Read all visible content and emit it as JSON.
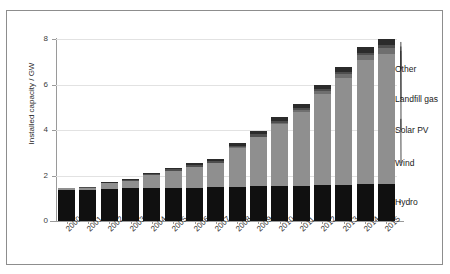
{
  "chart_data": {
    "type": "bar",
    "subtype": "stacked-bar",
    "title": "",
    "xlabel": "",
    "ylabel": "Installed capacity / GW",
    "ylim": [
      0,
      8
    ],
    "yticks": [
      0,
      2,
      4,
      6,
      8
    ],
    "ytick_labels": [
      "0",
      "2",
      "4",
      "6",
      "8"
    ],
    "grid": "horizontal",
    "legend": "annotated-callouts-right",
    "categories": [
      "2000",
      "2001",
      "2002",
      "2003",
      "2004",
      "2005",
      "2006",
      "2007",
      "2008",
      "2009",
      "2010",
      "2011",
      "2012",
      "2013",
      "2014",
      "2015"
    ],
    "series": [
      {
        "name": "Hydro",
        "color": "#101010",
        "values": [
          1.38,
          1.38,
          1.42,
          1.44,
          1.46,
          1.46,
          1.46,
          1.48,
          1.5,
          1.52,
          1.54,
          1.56,
          1.58,
          1.6,
          1.62,
          1.64
        ]
      },
      {
        "name": "Wind",
        "color": "#8f8f8f",
        "values": [
          0.05,
          0.07,
          0.23,
          0.33,
          0.56,
          0.76,
          0.92,
          1.08,
          1.7,
          2.16,
          2.72,
          3.22,
          4.0,
          4.68,
          5.44,
          5.7
        ]
      },
      {
        "name": "Solar PV",
        "color": "#6f6f6f",
        "values": [
          0.0,
          0.0,
          0.0,
          0.0,
          0.0,
          0.0,
          0.0,
          0.0,
          0.02,
          0.03,
          0.05,
          0.08,
          0.12,
          0.18,
          0.24,
          0.28
        ]
      },
      {
        "name": "Landfill gas",
        "color": "#4e4e4e",
        "values": [
          0.02,
          0.03,
          0.04,
          0.05,
          0.06,
          0.07,
          0.08,
          0.08,
          0.08,
          0.09,
          0.09,
          0.1,
          0.1,
          0.1,
          0.1,
          0.1
        ]
      },
      {
        "name": "Other",
        "color": "#2b2b2b",
        "values": [
          0.0,
          0.0,
          0.01,
          0.02,
          0.04,
          0.06,
          0.08,
          0.1,
          0.12,
          0.14,
          0.16,
          0.18,
          0.2,
          0.22,
          0.26,
          0.3
        ]
      }
    ],
    "totals": [
      1.45,
      1.48,
      1.7,
      1.84,
      2.12,
      2.35,
      2.54,
      2.74,
      3.42,
      3.94,
      4.56,
      5.14,
      6.0,
      6.78,
      7.66,
      8.02
    ],
    "annotations": [
      {
        "label": "Other"
      },
      {
        "label": "Landfill gas"
      },
      {
        "label": "Solar PV"
      },
      {
        "label": "Wind"
      },
      {
        "label": "Hydro"
      }
    ]
  },
  "colors": {
    "frame": "#8d8d8d",
    "axis": "#9a9a9a",
    "grid": "#e2e2e2",
    "background": "#ffffff",
    "text": "#1a1a1a"
  }
}
